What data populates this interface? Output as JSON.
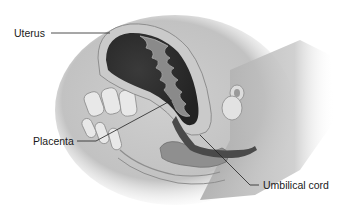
{
  "figure": {
    "labels": [
      {
        "id": "uterus",
        "text": "Uterus"
      },
      {
        "id": "placenta",
        "text": "Placenta"
      },
      {
        "id": "umbilical_cord",
        "text": "Umbilical cord"
      }
    ]
  },
  "colors": {
    "background": "#ffffff",
    "body_shadow": "#b8b8b8",
    "uterine_wall": "#c9c9c9",
    "uterine_cavity": "#2e2e2e",
    "placenta_tissue": "#7a7a7a",
    "bone": "#e6e6e6",
    "leader_line": "#222222"
  }
}
